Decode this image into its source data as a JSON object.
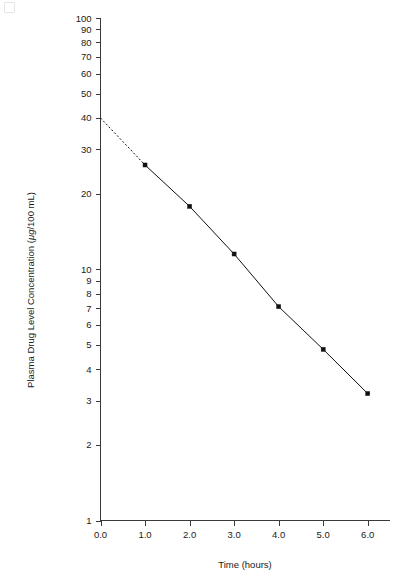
{
  "chart_data": {
    "type": "line",
    "title": "",
    "xlabel": "Time (hours)",
    "ylabel_prefix": "Plasma Drug Level Concentration (",
    "ylabel_unit": "μg",
    "ylabel_suffix": "/100 mL)",
    "yscale": "log",
    "xscale": "linear",
    "xlim": [
      0.0,
      6.5
    ],
    "ylim": [
      1,
      100
    ],
    "grid": false,
    "legend": "none",
    "x_ticks": [
      "0.0",
      "1.0",
      "2.0",
      "3.0",
      "4.0",
      "5.0",
      "6.0"
    ],
    "x_tick_values": [
      0.0,
      1.0,
      2.0,
      3.0,
      4.0,
      5.0,
      6.0
    ],
    "y_ticks": [
      "1",
      "2",
      "3",
      "4",
      "5",
      "6",
      "7",
      "8",
      "9",
      "10",
      "20",
      "30",
      "40",
      "50",
      "60",
      "70",
      "80",
      "90",
      "100"
    ],
    "y_tick_values": [
      1,
      2,
      3,
      4,
      5,
      6,
      7,
      8,
      9,
      10,
      20,
      30,
      40,
      50,
      60,
      70,
      80,
      90,
      100
    ],
    "series": [
      {
        "name": "Plasma drug concentration",
        "style": "solid-with-markers",
        "x": [
          1.0,
          2.0,
          3.0,
          4.0,
          5.0,
          6.0
        ],
        "values": [
          26.0,
          17.8,
          11.5,
          7.1,
          4.8,
          3.2
        ]
      },
      {
        "name": "Extrapolation to zero time",
        "style": "dotted",
        "x": [
          0.0,
          1.0
        ],
        "values": [
          40.0,
          26.0
        ]
      }
    ],
    "annotations": {
      "y_intercept": 40.0,
      "intercept_note": "Dotted line extrapolates back to the y-axis at 40"
    },
    "colors": {
      "line": "#111111",
      "axis": "#3a3a3a",
      "background": "#ffffff",
      "marker": "#111111"
    }
  }
}
